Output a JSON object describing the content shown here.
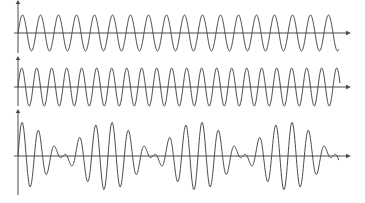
{
  "figure": {
    "background_color": "#ffffff",
    "line_color": "#4a4a4a",
    "stroke_width": 1,
    "arrow_size": 5,
    "width": 365,
    "height": 203,
    "waves": [
      {
        "id": "upper-sine-wave",
        "axis_y": 33,
        "y_axis_x": 18,
        "y_axis_top": 4,
        "y_axis_bottom": 53,
        "x_axis_start": 14,
        "x_axis_end": 346,
        "wave_x_start": 18,
        "wave_x_end": 339,
        "components": [
          {
            "amplitude_px": 18,
            "period_px": 18
          }
        ]
      },
      {
        "id": "middle-sine-wave",
        "axis_y": 87,
        "y_axis_x": 18,
        "y_axis_top": 60,
        "y_axis_bottom": 106,
        "x_axis_start": 14,
        "x_axis_end": 346,
        "wave_x_start": 18,
        "wave_x_end": 340,
        "components": [
          {
            "amplitude_px": 19,
            "period_px": 15
          }
        ]
      },
      {
        "id": "beat-superposition-wave",
        "axis_y": 156,
        "y_axis_x": 18,
        "y_axis_top": 113,
        "y_axis_bottom": 195,
        "x_axis_start": 14,
        "x_axis_end": 346,
        "wave_x_start": 18,
        "wave_x_end": 339,
        "components": [
          {
            "amplitude_px": 17,
            "period_px": 18
          },
          {
            "amplitude_px": 17,
            "period_px": 15
          }
        ]
      }
    ]
  },
  "chart_data": {
    "type": "line",
    "title": "",
    "xlabel": "",
    "ylabel": "",
    "legend": "none",
    "grid": false,
    "axes_style": "unlabeled arrowed axes, no ticks, no tick labels",
    "series": [
      {
        "name": "wave-1",
        "model": "y(x) = A * sin(2*pi*(x - x0)/T)",
        "amplitude_px": 18,
        "period_px": 18,
        "x0_px": 18,
        "x_range_px": [
          18,
          339
        ],
        "cycles": 17.8
      },
      {
        "name": "wave-2",
        "model": "y(x) = A * sin(2*pi*(x - x0)/T)",
        "amplitude_px": 19,
        "period_px": 15,
        "x0_px": 18,
        "x_range_px": [
          18,
          340
        ],
        "cycles": 21.5
      },
      {
        "name": "superposition (beats)",
        "model": "y(x) = A1*sin(2*pi*(x-x0)/T1) + A2*sin(2*pi*(x-x0)/T2)",
        "component_amplitudes_px": [
          17,
          17
        ],
        "component_periods_px": [
          18,
          15
        ],
        "x0_px": 18,
        "x_range_px": [
          18,
          339
        ],
        "beat_period_px": 90,
        "envelope_max_x_px": [
          18,
          108,
          198,
          288
        ],
        "envelope_node_x_px": [
          63,
          153,
          243,
          333
        ],
        "peak_envelope_amplitude_px": 34
      }
    ]
  }
}
